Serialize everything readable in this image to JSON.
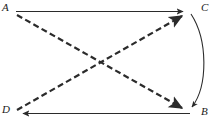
{
  "figure": {
    "type": "directed-graph-diagram",
    "background_color": "#ffffff",
    "stroke_color": "#2b2b2b",
    "width": 215,
    "height": 128
  },
  "vertices": [
    {
      "id": "A",
      "label": "A",
      "position": "top-left",
      "x": 16,
      "y": 12
    },
    {
      "id": "C",
      "label": "C",
      "position": "top-right",
      "x": 190,
      "y": 12
    },
    {
      "id": "D",
      "label": "D",
      "position": "bottom-left",
      "x": 16,
      "y": 113
    },
    {
      "id": "B",
      "label": "B",
      "position": "bottom-right",
      "x": 190,
      "y": 113
    }
  ],
  "edges": [
    {
      "id": "A-to-C",
      "from": "A",
      "to": "C",
      "style": "solid",
      "shape": "straight",
      "arrowhead": "at-target",
      "description": "solid horizontal arrow from A to C along the top"
    },
    {
      "id": "B-to-D",
      "from": "B",
      "to": "D",
      "style": "solid",
      "shape": "straight",
      "arrowhead": "at-target",
      "description": "solid horizontal arrow from B to D along the bottom"
    },
    {
      "id": "A-to-B",
      "from": "A",
      "to": "B",
      "style": "dashed",
      "shape": "straight",
      "arrowhead": "at-target",
      "description": "dashed diagonal arrow from A down to B"
    },
    {
      "id": "D-to-C",
      "from": "D",
      "to": "C",
      "style": "dashed",
      "shape": "straight",
      "arrowhead": "at-target",
      "description": "dashed diagonal arrow from D up to C"
    },
    {
      "id": "C-to-B",
      "from": "C",
      "to": "B",
      "style": "solid",
      "shape": "curved-right",
      "arrowhead": "at-target",
      "description": "solid curved arc from C to B bulging outward to the right"
    }
  ],
  "annotations": {
    "crossing_point": {
      "x": 103,
      "y": 62,
      "description": "the two dashed diagonals intersect near the center"
    }
  }
}
